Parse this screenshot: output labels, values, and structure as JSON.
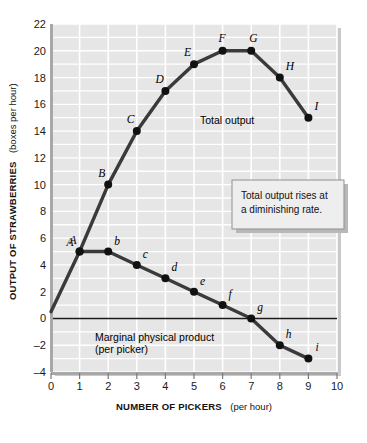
{
  "chart_data": {
    "type": "line",
    "title": "",
    "xlabel": "NUMBER OF PICKERS",
    "xlabel_sub": "(per hour)",
    "ylabel": "OUTPUT OF STRAWBERRIES",
    "ylabel_sub": "(boxes per hour)",
    "xlim": [
      0,
      10
    ],
    "ylim": [
      -4,
      22
    ],
    "xticks": [
      "0",
      "1",
      "2",
      "3",
      "4",
      "5",
      "6",
      "7",
      "8",
      "9",
      "10"
    ],
    "yticks": [
      "22",
      "20",
      "18",
      "16",
      "14",
      "12",
      "10",
      "8",
      "6",
      "4",
      "2",
      "0",
      "–2",
      "–4"
    ],
    "grid": true,
    "grid_color": "#ffffff",
    "plot_background": "#e6e6e6",
    "zero_line": 0,
    "legend_position": "inline-annotations",
    "series": [
      {
        "name": "Total output",
        "label": "Total output",
        "color": "#3a3a3a",
        "x": [
          0,
          1,
          2,
          3,
          4,
          5,
          6,
          7,
          8,
          9
        ],
        "values": [
          0.5,
          5,
          10,
          14,
          17,
          19,
          20,
          20,
          18,
          15
        ],
        "point_labels": [
          "",
          "A",
          "B",
          "C",
          "D",
          "E",
          "F",
          "G",
          "H",
          "I"
        ],
        "label_case": "upper"
      },
      {
        "name": "Marginal physical product",
        "label": "Marginal physical product",
        "label_sub": "(per picker)",
        "color": "#3a3a3a",
        "x": [
          1,
          2,
          3,
          4,
          5,
          6,
          7,
          8,
          9
        ],
        "values": [
          5,
          5,
          4,
          3,
          2,
          1,
          0,
          -2,
          -3
        ],
        "point_labels": [
          "A",
          "b",
          "c",
          "d",
          "e",
          "f",
          "g",
          "h",
          "i"
        ],
        "label_case": "lower"
      }
    ],
    "annotations": [
      {
        "id": "callout",
        "line1": "Total output rises at",
        "line2": "a diminishing rate.",
        "background": "#eeeeee",
        "border": "#9a9a9a"
      }
    ]
  }
}
